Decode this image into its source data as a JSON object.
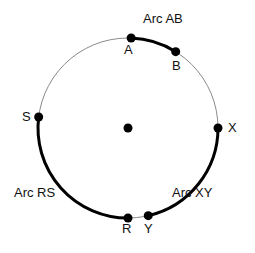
{
  "figure": {
    "type": "geometry-circle-arcs",
    "background_color": "#ffffff",
    "circle": {
      "center": {
        "x": 128,
        "y": 128,
        "marker": "center-dot"
      },
      "radius": 90,
      "thin_stroke_color": "#8a8a8a",
      "thick_stroke_color": "#000000",
      "thin_stroke_width": 1,
      "thick_stroke_width": 3
    },
    "points": [
      {
        "id": "A",
        "label": "A",
        "angle_deg": -88,
        "x": 131,
        "y": 38,
        "label_x": 124,
        "label_y": 43
      },
      {
        "id": "B",
        "label": "B",
        "angle_deg": -58,
        "x": 176,
        "y": 52,
        "label_x": 172,
        "label_y": 59
      },
      {
        "id": "X",
        "label": "X",
        "angle_deg": 0,
        "x": 218,
        "y": 128,
        "label_x": 228,
        "label_y": 121
      },
      {
        "id": "Y",
        "label": "Y",
        "angle_deg": 77,
        "x": 148,
        "y": 216,
        "label_x": 144,
        "label_y": 222
      },
      {
        "id": "R",
        "label": "R",
        "angle_deg": 90,
        "x": 128,
        "y": 218,
        "label_x": 122,
        "label_y": 222
      },
      {
        "id": "S",
        "label": "S",
        "angle_deg": 187,
        "x": 39,
        "y": 117,
        "label_x": 22,
        "label_y": 110
      }
    ],
    "arcs": [
      {
        "id": "arc-AB",
        "label": "Arc AB",
        "from": "A",
        "to": "B",
        "emphasis": "thick",
        "label_x": 143,
        "label_y": 12
      },
      {
        "id": "arc-XY",
        "label": "Arc XY",
        "from": "X",
        "to": "Y",
        "emphasis": "thick",
        "label_x": 172,
        "label_y": 186
      },
      {
        "id": "arc-RS",
        "label": "Arc RS",
        "from": "R",
        "to": "S",
        "emphasis": "thick",
        "label_x": 14,
        "label_y": 186
      }
    ],
    "dot_radius": 4.5,
    "center_dot_radius": 4.5
  }
}
